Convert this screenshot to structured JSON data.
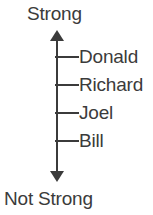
{
  "figure": {
    "axis": {
      "top_label": "Strong",
      "bottom_label": "Not Strong",
      "line_color": "#3b3b3b",
      "text_color": "#3b3b3b",
      "background_color": "#ffffff",
      "direction": "vertical-double-arrow"
    },
    "items": [
      {
        "label": "Donald",
        "tick_y": 57,
        "rank": 1
      },
      {
        "label": "Richard",
        "tick_y": 85,
        "rank": 2
      },
      {
        "label": "Joel",
        "tick_y": 113,
        "rank": 3
      },
      {
        "label": "Bill",
        "tick_y": 141,
        "rank": 4
      }
    ]
  },
  "chart_data": {
    "type": "scatter",
    "title": "",
    "xlabel": "",
    "ylabel": "Strength",
    "categories": [
      "Donald",
      "Richard",
      "Joel",
      "Bill"
    ],
    "values": [
      4,
      3,
      2,
      1
    ],
    "ylim": [
      0,
      5
    ],
    "axis_min_label": "Not Strong",
    "axis_max_label": "Strong",
    "grid": false,
    "legend": "none",
    "orientation": "vertical",
    "annotations": [
      "Strong",
      "Donald",
      "Richard",
      "Joel",
      "Bill",
      "Not Strong"
    ]
  }
}
